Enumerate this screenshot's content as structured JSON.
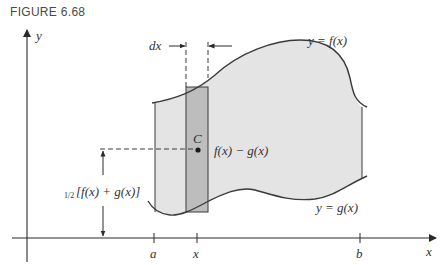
{
  "figure": {
    "caption": "FIGURE 6.68",
    "axes": {
      "x_label": "x",
      "y_label": "y",
      "ticks": [
        {
          "label": "a"
        },
        {
          "label": "x"
        },
        {
          "label": "b"
        }
      ]
    },
    "curves": {
      "upper": "y = f(x)",
      "lower": "y = g(x)"
    },
    "strip": {
      "width_label": "dx",
      "centroid_label": "C",
      "height_label": "f(x) − g(x)"
    },
    "centroid_height_label_frac": "1/2",
    "centroid_height_label_rest": "[f(x) + g(x)]",
    "colors": {
      "region_fill": "#e4e4e4",
      "strip_fill": "#bdbdbd",
      "line": "#3a3a3a"
    }
  }
}
